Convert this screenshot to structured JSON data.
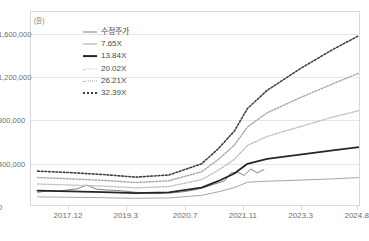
{
  "title": {
    "text": ""
  },
  "axis": {
    "unit_label": "(원)",
    "y_ticks": [
      "0",
      "400,000",
      "800,000",
      "1,600,000",
      "1,200,000"
    ],
    "y_tick_values": [
      0,
      400000,
      800000,
      1200000,
      1600000
    ],
    "y_tick_labels": [
      "0",
      "400,000",
      "800,000",
      "1,200,000",
      "1,600,000"
    ],
    "x_ticks": [
      "2017.12",
      "2019.3",
      "2020.7",
      "2021.11",
      "2023.3",
      "2024.8"
    ]
  },
  "legend": {
    "items": [
      {
        "label": "수정주가",
        "color": "#7f7f7f",
        "style": "solid",
        "width": 1.0
      },
      {
        "label": "7.65X",
        "color": "#a6a6a6",
        "style": "solid",
        "width": 1.0
      },
      {
        "label": "13.84X",
        "color": "#262626",
        "style": "solid",
        "width": 1.8
      },
      {
        "label": "20.02X",
        "color": "#bfbfbf",
        "style": "dotted",
        "width": 1.4
      },
      {
        "label": "26.21X",
        "color": "#a6a6a6",
        "style": "dotted",
        "width": 1.4
      },
      {
        "label": "32.39X",
        "color": "#404040",
        "style": "dotted",
        "width": 1.6
      }
    ]
  },
  "chart_data": {
    "type": "line",
    "title": "",
    "xlabel": "",
    "ylabel": "(원)",
    "ylim": [
      0,
      1800000
    ],
    "xlim": [
      0,
      100
    ],
    "grid": true,
    "legend_position": "inside-top-left",
    "x_tick_labels": [
      "2017.12",
      "2019.3",
      "2020.7",
      "2021.11",
      "2023.3",
      "2024.8"
    ],
    "x_tick_positions": [
      11.5,
      29.0,
      47.0,
      64.5,
      82.0,
      99.0
    ],
    "series": [
      {
        "name": "수정주가",
        "color": "#7f7f7f",
        "style": "solid",
        "width": 1.0,
        "x": [
          2,
          5,
          8,
          11,
          14,
          17,
          20,
          23,
          26,
          29,
          32,
          35,
          38,
          41,
          44,
          47,
          50,
          53,
          56,
          59,
          61,
          63,
          65,
          67,
          69,
          71
        ],
        "values": [
          118000,
          132000,
          126000,
          140000,
          150000,
          186000,
          148000,
          140000,
          136000,
          128000,
          118000,
          112000,
          106000,
          110000,
          116000,
          126000,
          142000,
          166000,
          196000,
          224000,
          300000,
          306000,
          276000,
          336000,
          300000,
          330000
        ]
      },
      {
        "name": "7.65X",
        "color": "#a6a6a6",
        "style": "solid",
        "width": 1.0,
        "x": [
          2,
          12,
          22,
          32,
          42,
          52,
          57,
          62,
          66,
          72,
          82,
          92,
          100
        ],
        "values": [
          76000,
          72000,
          68000,
          62000,
          66000,
          90000,
          122000,
          162000,
          212000,
          222000,
          232000,
          244000,
          256000
        ]
      },
      {
        "name": "13.84X",
        "color": "#262626",
        "style": "solid",
        "width": 1.8,
        "x": [
          2,
          12,
          22,
          32,
          42,
          52,
          57,
          62,
          66,
          72,
          82,
          92,
          100
        ],
        "values": [
          134000,
          128000,
          120000,
          110000,
          118000,
          162000,
          222000,
          294000,
          384000,
          430000,
          470000,
          510000,
          540000
        ]
      },
      {
        "name": "20.02X",
        "color": "#bfbfbf",
        "style": "dotted",
        "width": 1.4,
        "x": [
          2,
          12,
          22,
          32,
          42,
          52,
          57,
          62,
          66,
          72,
          82,
          92,
          100
        ],
        "values": [
          196000,
          186000,
          176000,
          160000,
          172000,
          236000,
          322000,
          426000,
          556000,
          640000,
          730000,
          820000,
          880000
        ]
      },
      {
        "name": "26.21X",
        "color": "#a6a6a6",
        "style": "dotted",
        "width": 1.4,
        "x": [
          2,
          12,
          22,
          32,
          42,
          52,
          57,
          62,
          66,
          72,
          82,
          92,
          100
        ],
        "values": [
          256000,
          244000,
          230000,
          210000,
          226000,
          310000,
          422000,
          558000,
          728000,
          860000,
          1000000,
          1130000,
          1230000
        ]
      },
      {
        "name": "32.39X",
        "color": "#404040",
        "style": "dotted",
        "width": 1.6,
        "x": [
          2,
          12,
          22,
          32,
          42,
          52,
          57,
          62,
          66,
          72,
          82,
          92,
          100
        ],
        "values": [
          316000,
          302000,
          284000,
          260000,
          280000,
          384000,
          522000,
          690000,
          900000,
          1070000,
          1270000,
          1450000,
          1580000
        ]
      }
    ]
  }
}
